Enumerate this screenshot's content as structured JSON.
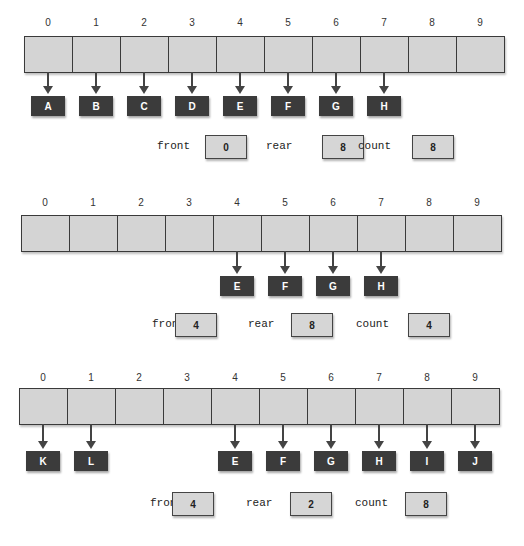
{
  "panels": [
    {
      "indices": [
        "0",
        "1",
        "2",
        "3",
        "4",
        "5",
        "6",
        "7",
        "8",
        "9"
      ],
      "nodes": [
        {
          "slot": 0,
          "label": "A"
        },
        {
          "slot": 1,
          "label": "B"
        },
        {
          "slot": 2,
          "label": "C"
        },
        {
          "slot": 3,
          "label": "D"
        },
        {
          "slot": 4,
          "label": "E"
        },
        {
          "slot": 5,
          "label": "F"
        },
        {
          "slot": 6,
          "label": "G"
        },
        {
          "slot": 7,
          "label": "H"
        }
      ],
      "front_label": "front",
      "front": "0",
      "rear_label": "rear",
      "rear": "8",
      "count_label": "count",
      "count": "8"
    },
    {
      "indices": [
        "0",
        "1",
        "2",
        "3",
        "4",
        "5",
        "6",
        "7",
        "8",
        "9"
      ],
      "nodes": [
        {
          "slot": 4,
          "label": "E"
        },
        {
          "slot": 5,
          "label": "F"
        },
        {
          "slot": 6,
          "label": "G"
        },
        {
          "slot": 7,
          "label": "H"
        }
      ],
      "front_label": "front",
      "front": "4",
      "rear_label": "rear",
      "rear": "8",
      "count_label": "count",
      "count": "4"
    },
    {
      "indices": [
        "0",
        "1",
        "2",
        "3",
        "4",
        "5",
        "6",
        "7",
        "8",
        "9"
      ],
      "nodes": [
        {
          "slot": 0,
          "label": "K"
        },
        {
          "slot": 1,
          "label": "L"
        },
        {
          "slot": 4,
          "label": "E"
        },
        {
          "slot": 5,
          "label": "F"
        },
        {
          "slot": 6,
          "label": "G"
        },
        {
          "slot": 7,
          "label": "H"
        },
        {
          "slot": 8,
          "label": "I"
        },
        {
          "slot": 9,
          "label": "J"
        }
      ],
      "front_label": "front",
      "front": "4",
      "rear_label": "rear",
      "rear": "2",
      "count_label": "count",
      "count": "8"
    }
  ],
  "colors": {
    "cell_fill": "#d4d4d4",
    "node_fill": "#3b3b3b",
    "border": "#3a3a3a"
  }
}
